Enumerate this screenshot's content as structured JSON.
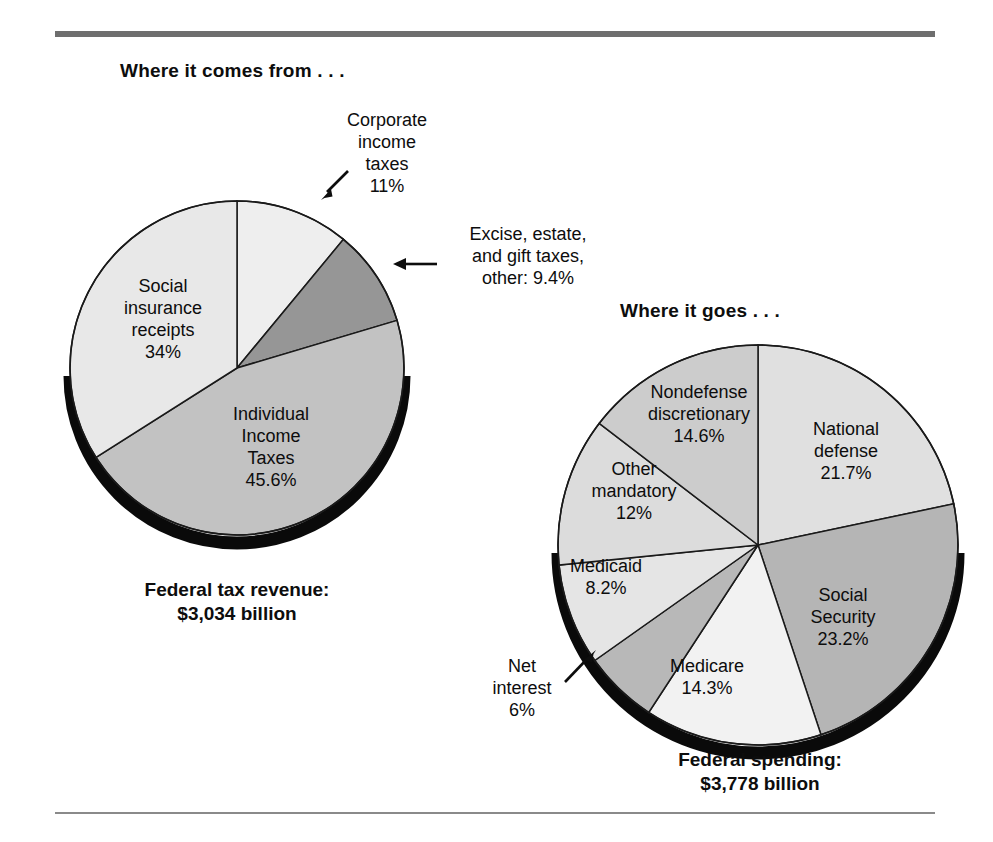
{
  "figure": {
    "left_panel_title": "Where it comes from . . .",
    "right_panel_title": "Where it goes . . .",
    "left_caption_line1": "Federal tax revenue:",
    "left_caption_line2": "$3,034 billion",
    "right_caption_line1": "Federal spending:",
    "right_caption_line2": "$3,778 billion"
  },
  "labels": {
    "corporate_l1": "Corporate",
    "corporate_l2": "income",
    "corporate_l3": "taxes",
    "corporate_l4": "11%",
    "excise_l1": "Excise, estate,",
    "excise_l2": "and gift taxes,",
    "excise_l3": "other: 9.4%",
    "social_ins_l1": "Social",
    "social_ins_l2": "insurance",
    "social_ins_l3": "receipts",
    "social_ins_l4": "34%",
    "individual_l1": "Individual",
    "individual_l2": "Income",
    "individual_l3": "Taxes",
    "individual_l4": "45.6%",
    "natdef_l1": "National",
    "natdef_l2": "defense",
    "natdef_l3": "21.7%",
    "ss_l1": "Social",
    "ss_l2": "Security",
    "ss_l3": "23.2%",
    "medicare_l1": "Medicare",
    "medicare_l2": "14.3%",
    "medicaid_l1": "Medicaid",
    "medicaid_l2": "8.2%",
    "othermand_l1": "Other",
    "othermand_l2": "mandatory",
    "othermand_l3": "12%",
    "nondef_l1": "Nondefense",
    "nondef_l2": "discretionary",
    "nondef_l3": "14.6%",
    "netint_l1": "Net",
    "netint_l2": "interest",
    "netint_l3": "6%"
  },
  "colors": {
    "rule_thick": "#6e6e6e",
    "rule_thin": "#8a8a8a",
    "outline": "#1a1a1a",
    "shadow": "#0a0a0a",
    "text": "#0d0d0d"
  },
  "chart_data": [
    {
      "type": "pie",
      "title": "Where it comes from . . .",
      "subtitle": "Federal tax revenue: $3,034 billion",
      "total_label": "$3,034 billion",
      "total_value": 3034,
      "units": "billions of dollars",
      "start_angle_deg": 0,
      "direction": "clockwise",
      "legend": "inside-slice labels with callouts",
      "grid": false,
      "categories": [
        "Corporate income taxes",
        "Excise, estate, and gift taxes, other",
        "Individual Income Taxes",
        "Social insurance receipts"
      ],
      "values": [
        11,
        9.4,
        45.6,
        34
      ],
      "value_labels": [
        "11%",
        "9.4%",
        "45.6%",
        "34%"
      ],
      "slice_colors": [
        "#eeeeee",
        "#969696",
        "#c2c2c2",
        "#e8e8e8"
      ],
      "annotations": [
        "Corporate income taxes 11% (arrow callout, upper right)",
        "Excise, estate, and gift taxes, other: 9.4% (arrow callout, right)"
      ]
    },
    {
      "type": "pie",
      "title": "Where it goes . . .",
      "subtitle": "Federal spending: $3,778 billion",
      "total_label": "$3,778 billion",
      "total_value": 3778,
      "units": "billions of dollars",
      "start_angle_deg": 0,
      "direction": "clockwise",
      "legend": "inside-slice labels with callout",
      "grid": false,
      "categories": [
        "National defense",
        "Social Security",
        "Medicare",
        "Net interest",
        "Medicaid",
        "Other mandatory",
        "Nondefense discretionary"
      ],
      "values": [
        21.7,
        23.2,
        14.3,
        6,
        8.2,
        12,
        14.6
      ],
      "value_labels": [
        "21.7%",
        "23.2%",
        "14.3%",
        "6%",
        "8.2%",
        "12%",
        "14.6%"
      ],
      "slice_colors": [
        "#e0e0e0",
        "#b5b5b5",
        "#f2f2f2",
        "#b8b8b8",
        "#e5e5e5",
        "#dcdcdc",
        "#cccccc"
      ],
      "annotations": [
        "Net interest 6% (arrow callout, lower left)"
      ]
    }
  ]
}
